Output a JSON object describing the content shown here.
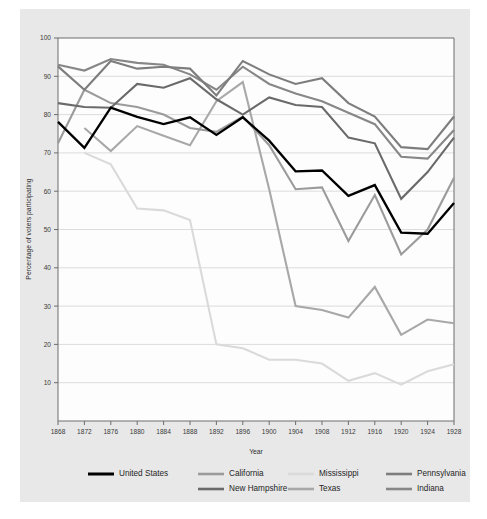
{
  "chart_data": {
    "type": "line",
    "title": "",
    "xlabel": "Year",
    "ylabel": "Percentage of voters participating",
    "xlim": [
      1868,
      1928
    ],
    "ylim": [
      0,
      100
    ],
    "ytick_start": 10,
    "ytick_step": 10,
    "grid": true,
    "legend_position": "bottom",
    "x": [
      1868,
      1872,
      1876,
      1880,
      1884,
      1888,
      1892,
      1896,
      1900,
      1904,
      1908,
      1912,
      1916,
      1920,
      1924,
      1928
    ],
    "xticks": [
      "1868",
      "1872",
      "1876",
      "1880",
      "1884",
      "1888",
      "1892",
      "1896",
      "1900",
      "1904",
      "1908",
      "1912",
      "1916",
      "1920",
      "1924",
      "1928"
    ],
    "yticks": [
      "10",
      "20",
      "30",
      "40",
      "50",
      "60",
      "70",
      "80",
      "90",
      "100"
    ],
    "series": [
      {
        "name": "United States",
        "color": "#000000",
        "width": 2.3,
        "values": [
          78.1,
          71.3,
          81.8,
          79.4,
          77.5,
          79.3,
          74.7,
          79.3,
          73.2,
          65.2,
          65.4,
          58.8,
          61.6,
          49.2,
          48.9,
          56.9
        ]
      },
      {
        "name": "California",
        "color": "#9b9b9b",
        "width": 2.1,
        "values": [
          72.5,
          86.5,
          83.0,
          82.0,
          80.0,
          76.5,
          75.5,
          79.5,
          72.0,
          60.5,
          61.0,
          47.0,
          59.0,
          43.5,
          50.0,
          63.5
        ]
      },
      {
        "name": "Mississippi",
        "color": "#dadada",
        "width": 2.1,
        "values": [
          null,
          70.0,
          67.0,
          55.5,
          55.0,
          52.5,
          20.0,
          19.0,
          16.0,
          16.0,
          15.0,
          10.5,
          12.5,
          9.5,
          13.0,
          14.8
        ]
      },
      {
        "name": "Pennsylvania",
        "color": "#7d7d7d",
        "width": 2.1,
        "values": [
          92.6,
          86.5,
          94.0,
          92.0,
          92.5,
          92.0,
          85.0,
          94.0,
          90.5,
          88.0,
          89.5,
          83.0,
          79.5,
          71.5,
          71.0,
          79.5
        ]
      },
      {
        "name": "New Hampshire",
        "color": "#6a6a6a",
        "width": 2.1,
        "values": [
          83.0,
          82.0,
          81.8,
          88.0,
          87.0,
          89.5,
          84.0,
          80.0,
          84.5,
          82.5,
          82.0,
          74.0,
          72.5,
          58.0,
          65.0,
          74.0
        ]
      },
      {
        "name": "Texas",
        "color": "#a8a8a8",
        "width": 2.1,
        "values": [
          null,
          76.5,
          70.5,
          77.0,
          74.5,
          72.0,
          83.5,
          88.5,
          60.5,
          30.0,
          29.0,
          27.0,
          35.0,
          22.5,
          26.5,
          25.5
        ]
      },
      {
        "name": "Indiana",
        "color": "#878787",
        "width": 2.1,
        "values": [
          93.0,
          91.5,
          94.5,
          93.5,
          93.0,
          90.5,
          86.5,
          92.5,
          88.0,
          85.5,
          83.5,
          80.5,
          77.5,
          69.0,
          68.5,
          76.0
        ]
      }
    ],
    "legend": [
      {
        "label": "United States",
        "color": "#000000",
        "width": 3.0,
        "col": 0,
        "row": 0
      },
      {
        "label": "California",
        "color": "#9b9b9b",
        "width": 2.6,
        "col": 1,
        "row": 0
      },
      {
        "label": "New Hampshire",
        "color": "#6a6a6a",
        "width": 2.6,
        "col": 1,
        "row": 1
      },
      {
        "label": "Mississippi",
        "color": "#dadada",
        "width": 2.6,
        "col": 2,
        "row": 0
      },
      {
        "label": "Texas",
        "color": "#a8a8a8",
        "width": 2.6,
        "col": 2,
        "row": 1
      },
      {
        "label": "Pennsylvania",
        "color": "#7d7d7d",
        "width": 2.6,
        "col": 3,
        "row": 0
      },
      {
        "label": "Indiana",
        "color": "#878787",
        "width": 2.6,
        "col": 3,
        "row": 1
      }
    ]
  },
  "figure": {
    "card_bg": "#e8e8e8",
    "plot_bg": "#fdfdfd",
    "axis_color": "#6d6d6d",
    "grid_color": "#dcdcdc"
  }
}
